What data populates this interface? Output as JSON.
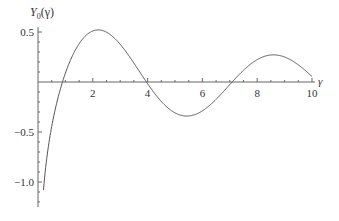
{
  "chart_data": {
    "type": "line",
    "title": "",
    "xlabel": "γ",
    "ylabel": "Y0(γ)",
    "ylabel_main": "Y",
    "ylabel_sub": "0",
    "ylabel_arg": "(γ)",
    "xlim": [
      0,
      10
    ],
    "ylim": [
      -1.25,
      0.55
    ],
    "grid": false,
    "x_ticks": [
      2,
      4,
      6,
      8,
      10
    ],
    "x_tick_labels": [
      "2",
      "4",
      "6",
      "8",
      "10"
    ],
    "y_ticks": [
      0.5,
      -0.5,
      -1.0
    ],
    "y_tick_labels": [
      "0.5",
      "−0.5",
      "−1.0"
    ],
    "series": [
      {
        "name": "Y0(γ)",
        "function": "Bessel function of the second kind, order 0",
        "x": [
          0.3,
          0.5,
          0.89,
          1.0,
          1.5,
          2.0,
          2.2,
          3.0,
          3.96,
          4.5,
          5.0,
          5.43,
          6.0,
          7.09,
          8.0,
          8.6,
          9.0,
          10.0
        ],
        "values": [
          -0.807,
          -0.445,
          0.0,
          0.088,
          0.382,
          0.51,
          0.521,
          0.377,
          0.0,
          -0.195,
          -0.309,
          -0.34,
          -0.288,
          0.0,
          0.223,
          0.273,
          0.25,
          0.056
        ]
      }
    ],
    "line_color": "#555555"
  }
}
